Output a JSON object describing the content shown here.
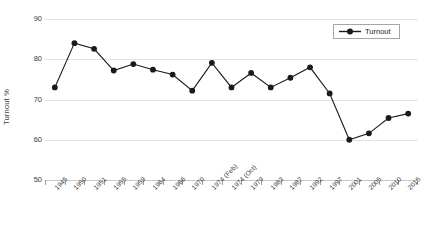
{
  "chart_data": {
    "type": "line",
    "title": "",
    "xlabel": "",
    "ylabel": "Turnout %",
    "ylim": [
      50,
      90
    ],
    "ytick_values": [
      90,
      80,
      70,
      60,
      50
    ],
    "ytick_labels": [
      "90",
      "80",
      "70",
      "60",
      "50"
    ],
    "grid": true,
    "legend_position": "top-right",
    "categories": [
      "1945",
      "1950",
      "1951",
      "1955",
      "1959",
      "1964",
      "1966",
      "1970",
      "1974 (Feb)",
      "1974 (Oct)",
      "1979",
      "1983",
      "1987",
      "1992",
      "1997",
      "2001",
      "2005",
      "2010",
      "2015"
    ],
    "series": [
      {
        "name": "Turnout",
        "color": "#1a1a1a",
        "marker": "circle",
        "values": [
          73.0,
          84.0,
          82.6,
          77.2,
          78.8,
          77.4,
          76.2,
          72.2,
          79.1,
          73.0,
          76.6,
          73.0,
          75.4,
          78.0,
          71.5,
          60.0,
          61.6,
          65.4,
          66.5
        ]
      }
    ]
  },
  "legend": {
    "entries": [
      {
        "label": "Turnout"
      }
    ]
  },
  "axes": {
    "y_title": "Turnout %"
  }
}
